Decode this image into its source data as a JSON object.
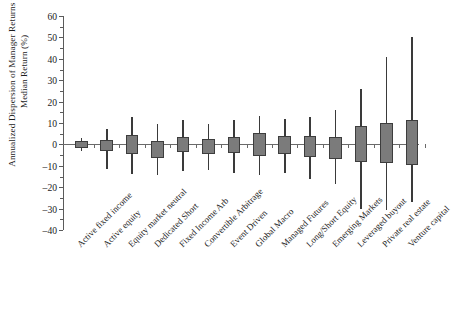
{
  "chart_data": {
    "type": "box",
    "title": "",
    "xlabel": "",
    "ylabel": "Annualized Dispersion of Manager Returns versus Median Return (%)",
    "ylim": [
      -40,
      60
    ],
    "ytick_labels": [
      "60",
      "50",
      "40",
      "30",
      "20",
      "10",
      "0",
      "–10",
      "–20",
      "–30",
      "–40"
    ],
    "ytick_values": [
      60,
      50,
      40,
      30,
      20,
      10,
      0,
      -10,
      -20,
      -30,
      -40
    ],
    "minor_tick_step": 5,
    "grid": false,
    "legend": "none",
    "zero_reference_line": true,
    "categories": [
      "Active fixed income",
      "Active equity",
      "Equity market neutral",
      "Dedicated Short",
      "Fixed Income Arb",
      "Convertible Arbitrage",
      "Event Driven",
      "Global Macro",
      "Managed Futures",
      "Long/Short Equity",
      "Emerging Markets",
      "Leveraged buyout",
      "Private real estate",
      "Venture capital"
    ],
    "boxes": [
      {
        "category": "Active fixed income",
        "whisker_high": 3.0,
        "q3": 1.6,
        "q1": -1.6,
        "whisker_low": -3.0
      },
      {
        "category": "Active equity",
        "whisker_high": 7.0,
        "q3": 2.2,
        "q1": -3.2,
        "whisker_low": -11.5
      },
      {
        "category": "Equity market neutral",
        "whisker_high": 13.0,
        "q3": 4.5,
        "q1": -4.5,
        "whisker_low": -14.0
      },
      {
        "category": "Dedicated Short",
        "whisker_high": 9.5,
        "q3": 1.5,
        "q1": -6.5,
        "whisker_low": -14.5
      },
      {
        "category": "Fixed Income Arb",
        "whisker_high": 11.5,
        "q3": 3.5,
        "q1": -3.5,
        "whisker_low": -12.5
      },
      {
        "category": "Convertible Arbitrage",
        "whisker_high": 9.5,
        "q3": 2.5,
        "q1": -4.5,
        "whisker_low": -12.0
      },
      {
        "category": "Event Driven",
        "whisker_high": 11.5,
        "q3": 3.5,
        "q1": -4.0,
        "whisker_low": -13.5
      },
      {
        "category": "Global Macro",
        "whisker_high": 13.5,
        "q3": 5.5,
        "q1": -5.5,
        "whisker_low": -14.5
      },
      {
        "category": "Managed Futures",
        "whisker_high": 12.0,
        "q3": 4.0,
        "q1": -4.5,
        "whisker_low": -13.5
      },
      {
        "category": "Long/Short Equity",
        "whisker_high": 13.0,
        "q3": 4.0,
        "q1": -6.0,
        "whisker_low": -16.0
      },
      {
        "category": "Emerging Markets",
        "whisker_high": 16.0,
        "q3": 3.5,
        "q1": -7.0,
        "whisker_low": -18.5
      },
      {
        "category": "Leveraged buyout",
        "whisker_high": 26.0,
        "q3": 8.5,
        "q1": -8.0,
        "whisker_low": -30.0
      },
      {
        "category": "Private real estate",
        "whisker_high": 41.0,
        "q3": 10.0,
        "q1": -8.5,
        "whisker_low": -30.5
      },
      {
        "category": "Venture capital",
        "whisker_high": 50.0,
        "q3": 11.5,
        "q1": -9.5,
        "whisker_low": -27.0
      }
    ]
  }
}
